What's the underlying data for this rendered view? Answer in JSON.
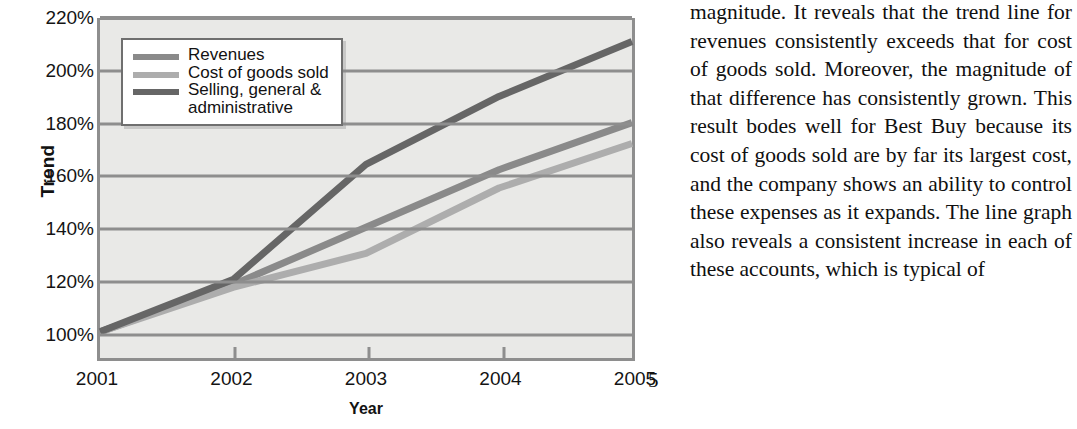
{
  "chart_data": {
    "type": "line",
    "title": "",
    "xlabel": "Year",
    "ylabel": "Trend",
    "x": [
      "2001",
      "2002",
      "2003",
      "2004",
      "2005"
    ],
    "categories": [
      "2001",
      "2002",
      "2003",
      "2004",
      "2005"
    ],
    "ylim": [
      90,
      220
    ],
    "ytick_values": [
      220,
      200,
      180,
      160,
      140,
      120,
      100
    ],
    "ytick_labels": [
      "220%",
      "200%",
      "180%",
      "160%",
      "140%",
      "120%",
      "100%"
    ],
    "grid": true,
    "legend_position": "upper-left-inside",
    "plot_background": "#e9e9e7",
    "axis_color": "#8e8e8e",
    "series": [
      {
        "name": "Revenues",
        "color": "#8a8a8a",
        "values": [
          100,
          118,
          140,
          162,
          180
        ]
      },
      {
        "name": "Cost of goods sold",
        "color": "#adadad",
        "values": [
          100,
          117,
          130,
          155,
          172
        ]
      },
      {
        "name": "Selling, general &\nadministrative",
        "color": "#666666",
        "values": [
          100,
          120,
          164,
          190,
          211
        ]
      }
    ]
  },
  "legend": {
    "items": [
      {
        "label": "Revenues",
        "color": "#8a8a8a"
      },
      {
        "label": "Cost of goods sold",
        "color": "#adadad"
      },
      {
        "label": "Selling, general &\nadministrative",
        "color": "#666666"
      }
    ]
  },
  "axes": {
    "y_title": "Trend",
    "x_title": "Year",
    "y_labels": [
      "220%",
      "200%",
      "180%",
      "160%",
      "140%",
      "120%",
      "100%"
    ],
    "x_labels": [
      "2001",
      "2002",
      "2003",
      "2004",
      "2005"
    ]
  },
  "body_text": {
    "paragraph": "magnitude. It reveals that the trend line for revenues consistently exceeds that for cost of goods sold. Moreover, the magnitude of that difference has consistently grown. This result bodes well for Best Buy because its cost of goods sold are by far its largest cost, and the company shows an ability to control these expenses as it expands. The line graph also reveals a consistent increase in each of these accounts, which is typical of"
  },
  "folio": {
    "page_number": "5"
  }
}
